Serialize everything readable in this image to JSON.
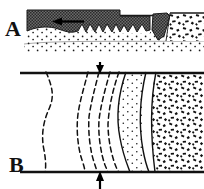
{
  "figure": {
    "title": "",
    "panels": [
      {
        "id": "A",
        "label": "A",
        "view": "cross-section",
        "elements": {
          "dark_layer_name": "dark-hatched-layer",
          "jagged_base_name": "jagged-contact",
          "arrow_label": "",
          "arrow_direction": "left",
          "stipple_name": "fine-stipple-unit",
          "wedge_name": "dark-wedge",
          "breccia_name": "coarse-breccia-unit"
        }
      },
      {
        "id": "B",
        "label": "B",
        "view": "plan",
        "elements": {
          "top_boundary_name": "upper-boundary-line",
          "bottom_boundary_name": "lower-boundary-line",
          "top_arrow_direction": "down",
          "bottom_arrow_direction": "up",
          "dashed_fold_name": "dashed-fold-trace",
          "stipple_lens_name": "fine-stipple-lens",
          "breccia_name": "coarse-breccia-unit"
        }
      }
    ],
    "colors": {
      "ink": "#111111",
      "dark_fill": "#5a5a5a",
      "paper": "#ffffff"
    }
  }
}
